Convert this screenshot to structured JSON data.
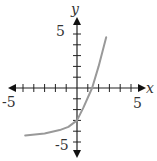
{
  "chart_data": {
    "type": "line",
    "title": "",
    "xlabel": "x",
    "ylabel": "y",
    "xlim": [
      -5,
      5
    ],
    "ylim": [
      -5,
      5
    ],
    "tick_step": 1,
    "x_tick_labels": [
      "-5",
      "5"
    ],
    "y_tick_labels": [
      "5",
      "-5"
    ],
    "grid": false,
    "series": [
      {
        "name": "f(x)",
        "color": "#999999",
        "x": [
          -4.8,
          -3,
          -1.6,
          -0.8,
          0,
          0.6,
          1.4,
          2.0,
          2.7
        ],
        "y": [
          -4.4,
          -4.2,
          -3.9,
          -3.6,
          -3.0,
          -1.8,
          0,
          2.0,
          4.7
        ]
      }
    ],
    "annotations": {
      "y_intercept": -3,
      "x_intercept": 1.4,
      "asymptote_left": -4.5
    }
  },
  "axes": {
    "x_label": "x",
    "y_label": "y",
    "x_min_label": "-5",
    "x_max_label": "5",
    "y_max_label": "5",
    "y_min_label": "-5"
  }
}
